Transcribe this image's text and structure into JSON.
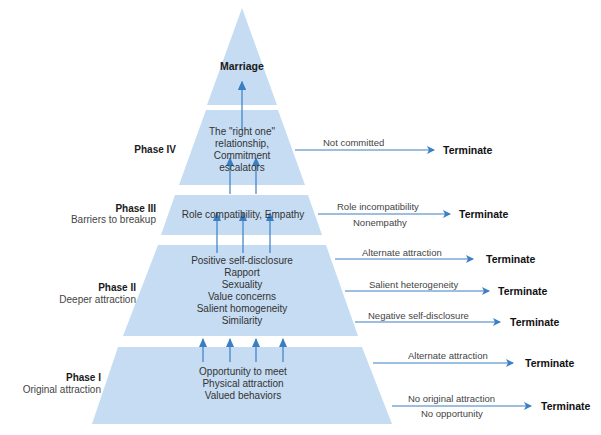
{
  "diagram": {
    "apex_label": "Marriage",
    "phases": [
      {
        "id": "phase-iv",
        "title": "Phase IV",
        "subtitle": "",
        "factors": [
          "The \"right one\"",
          "relationship,",
          "Commitment",
          "escalators"
        ],
        "exits": [
          {
            "reasons": [
              "Not committed"
            ],
            "outcome": "Terminate"
          }
        ]
      },
      {
        "id": "phase-iii",
        "title": "Phase III",
        "subtitle": "Barriers to breakup",
        "factors": [
          "Role compatibility, Empathy"
        ],
        "exits": [
          {
            "reasons": [
              "Role incompatibility",
              "Nonempathy"
            ],
            "outcome": "Terminate"
          }
        ]
      },
      {
        "id": "phase-ii",
        "title": "Phase II",
        "subtitle": "Deeper attraction",
        "factors": [
          "Positive self-disclosure",
          "Rapport",
          "Sexuality",
          "Value concerns",
          "Salient homogeneity",
          "Similarity"
        ],
        "exits": [
          {
            "reasons": [
              "Alternate attraction"
            ],
            "outcome": "Terminate"
          },
          {
            "reasons": [
              "Salient heterogeneity"
            ],
            "outcome": "Terminate"
          },
          {
            "reasons": [
              "Negative self-disclosure"
            ],
            "outcome": "Terminate"
          }
        ]
      },
      {
        "id": "phase-i",
        "title": "Phase I",
        "subtitle": "Original attraction",
        "factors": [
          "Opportunity to meet",
          "Physical attraction",
          "Valued behaviors"
        ],
        "exits": [
          {
            "reasons": [
              "Alternate attraction"
            ],
            "outcome": "Terminate"
          },
          {
            "reasons": [
              "No original attraction",
              "No opportunity"
            ],
            "outcome": "Terminate"
          }
        ]
      }
    ],
    "colors": {
      "layer_fill": "#c5dcf2",
      "arrow": "#3a7fc4",
      "text": "#333333",
      "bold_text": "#111111"
    }
  }
}
